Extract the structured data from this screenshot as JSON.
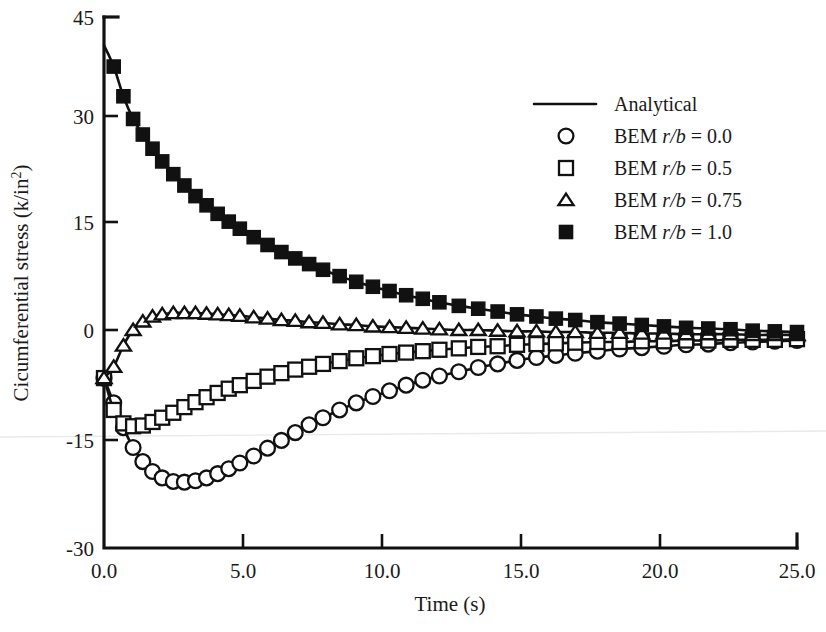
{
  "chart_data": {
    "type": "line",
    "title": "",
    "xlabel": "Time (s)",
    "ylabel": "Cicumferential stress (k/in2)",
    "ylabel_display": "Cicumferential stress (k/in",
    "ylabel_superscript": "2",
    "ylabel_suffix": ")",
    "xlim": [
      0.0,
      25.0
    ],
    "ylim": [
      -30,
      45
    ],
    "xticks": [
      0.0,
      5.0,
      10.0,
      15.0,
      20.0,
      25.0
    ],
    "xticklabels": [
      "0.0",
      "5.0",
      "10.0",
      "15.0",
      "20.0",
      "25.0"
    ],
    "yticks": [
      -30,
      -15,
      0,
      15,
      30,
      45
    ],
    "yticklabels": [
      "-30",
      "-15",
      "0",
      "15",
      "30",
      "45"
    ],
    "grid": false,
    "legend_position": "upper right",
    "series": [
      {
        "name": "Analytical",
        "marker": "none",
        "style": "solid-line",
        "note": "solid analytical curve drawn through every BEM dataset"
      },
      {
        "name": "BEM r/b = 0.0",
        "marker": "open-circle",
        "x": [
          0.0,
          0.35,
          0.7,
          1.05,
          1.4,
          1.75,
          2.1,
          2.5,
          2.9,
          3.3,
          3.7,
          4.1,
          4.5,
          4.9,
          5.4,
          5.9,
          6.4,
          6.9,
          7.4,
          7.9,
          8.5,
          9.1,
          9.7,
          10.3,
          10.9,
          11.5,
          12.1,
          12.8,
          13.5,
          14.2,
          14.9,
          15.6,
          16.3,
          17.0,
          17.8,
          18.6,
          19.4,
          20.2,
          21.0,
          21.8,
          22.6,
          23.4,
          24.2,
          25.0
        ],
        "y": [
          -6.0,
          -9.5,
          -13.0,
          -15.8,
          -17.8,
          -19.2,
          -20.1,
          -20.6,
          -20.7,
          -20.5,
          -20.1,
          -19.5,
          -18.8,
          -18.0,
          -17.0,
          -15.9,
          -14.8,
          -13.7,
          -12.6,
          -11.6,
          -10.5,
          -9.5,
          -8.6,
          -7.8,
          -7.0,
          -6.3,
          -5.7,
          -5.1,
          -4.5,
          -4.0,
          -3.5,
          -3.1,
          -2.8,
          -2.5,
          -2.2,
          -1.9,
          -1.7,
          -1.5,
          -1.3,
          -1.2,
          -1.0,
          -0.9,
          -0.8,
          -0.7
        ]
      },
      {
        "name": "BEM r/b = 0.5",
        "marker": "open-square",
        "x": [
          0.0,
          0.35,
          0.7,
          1.05,
          1.4,
          1.75,
          2.1,
          2.5,
          2.9,
          3.3,
          3.7,
          4.1,
          4.5,
          4.9,
          5.4,
          5.9,
          6.4,
          6.9,
          7.4,
          7.9,
          8.5,
          9.1,
          9.7,
          10.3,
          10.9,
          11.5,
          12.1,
          12.8,
          13.5,
          14.2,
          14.9,
          15.6,
          16.3,
          17.0,
          17.8,
          18.6,
          19.4,
          20.2,
          21.0,
          21.8,
          22.6,
          23.4,
          24.2,
          25.0
        ],
        "y": [
          -6.0,
          -10.5,
          -12.4,
          -12.8,
          -12.7,
          -12.2,
          -11.6,
          -10.9,
          -10.1,
          -9.4,
          -8.7,
          -8.1,
          -7.5,
          -7.0,
          -6.4,
          -5.8,
          -5.3,
          -4.8,
          -4.4,
          -4.0,
          -3.6,
          -3.2,
          -2.9,
          -2.6,
          -2.4,
          -2.2,
          -2.0,
          -1.8,
          -1.6,
          -1.5,
          -1.3,
          -1.2,
          -1.1,
          -1.0,
          -0.9,
          -0.9,
          -0.8,
          -0.8,
          -0.7,
          -0.7,
          -0.6,
          -0.6,
          -0.6,
          -0.5
        ]
      },
      {
        "name": "BEM r/b = 0.75",
        "marker": "open-triangle",
        "x": [
          0.0,
          0.35,
          0.7,
          1.05,
          1.4,
          1.75,
          2.1,
          2.5,
          2.9,
          3.3,
          3.7,
          4.1,
          4.5,
          4.9,
          5.4,
          5.9,
          6.4,
          6.9,
          7.4,
          7.9,
          8.5,
          9.1,
          9.7,
          10.3,
          10.9,
          11.5,
          12.1,
          12.8,
          13.5,
          14.2,
          14.9,
          15.6,
          16.3,
          17.0,
          17.8,
          18.6,
          19.4,
          20.2,
          21.0,
          21.8,
          22.6,
          23.4,
          24.2,
          25.0
        ],
        "y": [
          -6.0,
          -4.4,
          -1.4,
          0.8,
          2.0,
          2.7,
          3.0,
          3.2,
          3.2,
          3.2,
          3.1,
          3.0,
          2.9,
          2.8,
          2.6,
          2.4,
          2.2,
          2.1,
          1.9,
          1.8,
          1.6,
          1.5,
          1.3,
          1.2,
          1.1,
          1.0,
          0.9,
          0.8,
          0.8,
          0.7,
          0.6,
          0.6,
          0.5,
          0.5,
          0.4,
          0.4,
          0.3,
          0.3,
          0.2,
          0.2,
          0.2,
          0.1,
          0.1,
          0.1
        ]
      },
      {
        "name": "BEM r/b = 1.0",
        "marker": "filled-square",
        "x": [
          0.0,
          0.35,
          0.7,
          1.05,
          1.4,
          1.75,
          2.1,
          2.5,
          2.9,
          3.3,
          3.7,
          4.1,
          4.5,
          4.9,
          5.4,
          5.9,
          6.4,
          6.9,
          7.4,
          7.9,
          8.5,
          9.1,
          9.7,
          10.3,
          10.9,
          11.5,
          12.1,
          12.8,
          13.5,
          14.2,
          14.9,
          15.6,
          16.3,
          17.0,
          17.8,
          18.6,
          19.4,
          20.2,
          21.0,
          21.8,
          22.6,
          23.4,
          24.2,
          25.0
        ],
        "y": [
          41.0,
          38.0,
          33.8,
          30.6,
          28.4,
          26.4,
          24.6,
          22.8,
          21.2,
          19.7,
          18.4,
          17.2,
          16.1,
          15.1,
          13.9,
          12.8,
          11.8,
          10.9,
          10.1,
          9.3,
          8.4,
          7.6,
          6.9,
          6.3,
          5.7,
          5.2,
          4.7,
          4.2,
          3.8,
          3.4,
          3.0,
          2.7,
          2.4,
          2.2,
          1.9,
          1.7,
          1.5,
          1.3,
          1.1,
          1.0,
          0.9,
          0.7,
          0.6,
          0.5
        ]
      }
    ]
  },
  "legend": {
    "entries": [
      {
        "label": "Analytical",
        "marker": "line",
        "prefix": "Analytical",
        "italic": "",
        "suffix": ""
      },
      {
        "label": "BEM r/b = 0.0",
        "marker": "open-circle",
        "prefix": "BEM ",
        "italic": "r/b",
        "suffix": " = 0.0"
      },
      {
        "label": "BEM r/b = 0.5",
        "marker": "open-square",
        "prefix": "BEM ",
        "italic": "r/b",
        "suffix": " = 0.5"
      },
      {
        "label": "BEM r/b = 0.75",
        "marker": "open-triangle",
        "prefix": "BEM ",
        "italic": "r/b",
        "suffix": " = 0.75"
      },
      {
        "label": "BEM r/b = 1.0",
        "marker": "filled-square",
        "prefix": "BEM ",
        "italic": "r/b",
        "suffix": " = 1.0"
      }
    ]
  },
  "colors": {
    "ink": "#111111",
    "text": "#1a1a1a",
    "background": "#ffffff",
    "scan_artifact": "#e9e9ec"
  }
}
